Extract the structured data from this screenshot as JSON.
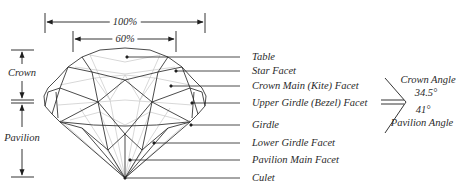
{
  "diagram": {
    "type": "round brilliant diamond facet anatomy",
    "width_labels": {
      "total_diameter": "100%",
      "table_width": "60%"
    },
    "height_labels": {
      "crown": "Crown",
      "pavilion": "Pavilion"
    },
    "facet_labels": [
      {
        "id": "table",
        "label": "Table"
      },
      {
        "id": "star-facet",
        "label": "Star Facet"
      },
      {
        "id": "crown-main-facet",
        "label": "Crown Main (Kite) Facet"
      },
      {
        "id": "upper-girdle-facet",
        "label": "Upper Girdle (Bezel) Facet"
      },
      {
        "id": "girdle",
        "label": "Girdle"
      },
      {
        "id": "lower-girdle-facet",
        "label": "Lower Girdle Facet"
      },
      {
        "id": "pavilion-main-facet",
        "label": "Pavilion Main Facet"
      },
      {
        "id": "culet",
        "label": "Culet"
      }
    ],
    "angles": {
      "crown_angle_label": "Crown Angle",
      "crown_angle_value": "34.5°",
      "pavilion_angle_value": "41°",
      "pavilion_angle_label": "Pavilion Angle"
    },
    "colors": {
      "ink": "#1e1e1e",
      "facet_light": "#b8b8b8",
      "background": "#ffffff"
    }
  }
}
